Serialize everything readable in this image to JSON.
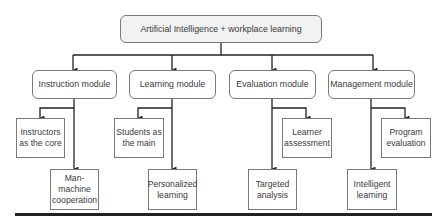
{
  "diagram": {
    "type": "hierarchy",
    "root": {
      "label": "Artificial Intelligence + workplace learning"
    },
    "modules": [
      {
        "label": "Instruction module",
        "children": [
          "Instructors as the core",
          "Man-machine cooperation"
        ]
      },
      {
        "label": "Learning module",
        "children": [
          "Students as the main",
          "Personalized learning"
        ]
      },
      {
        "label": "Evaluation module",
        "children": [
          "Learner assessment",
          "Targeted analysis"
        ]
      },
      {
        "label": "Management module",
        "children": [
          "Program evaluation",
          "Intelligent learning"
        ]
      }
    ],
    "leaves": {
      "instructors": "Instructors\nas the core",
      "man_machine": "Man-\nmachine\ncooperation",
      "students": "Students as\nthe main",
      "personalized": "Personalized\nlearning",
      "learner": "Learner\nassessment",
      "targeted": "Targeted\nanalysis",
      "program": "Program\nevaluation",
      "intelligent": "Intelligent\nlearning"
    },
    "colors": {
      "line": "#222222",
      "box_border": "#7a7a7a",
      "root_fill": "#f2f2f2"
    }
  }
}
